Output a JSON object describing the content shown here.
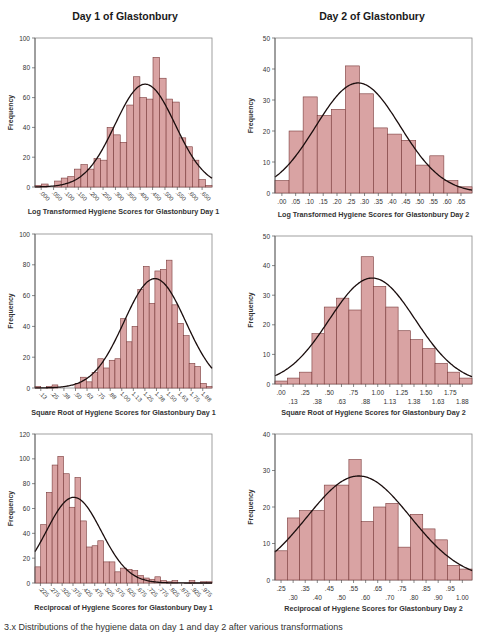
{
  "column_titles": [
    "Day 1 of Glastonbury",
    "Day 2 of Glastonbury"
  ],
  "caption": "3.x  Distributions of the hygiene data on day 1 and day 2 after various transformations",
  "colors": {
    "bar_fill": "#d9a3a3",
    "bar_stroke": "#7a3b3b",
    "curve": "#1a0d0d",
    "axis": "#555555",
    "frame": "#888888",
    "text": "#333333"
  },
  "chart_data": [
    {
      "id": "log-day1",
      "type": "bar",
      "title": "",
      "xlabel": "Log Transformed Hygiene Scores for Glastonbury Day 1",
      "ylabel": "Frequency",
      "ylim": [
        0,
        100
      ],
      "yticks": [
        0,
        20,
        40,
        60,
        80,
        100
      ],
      "xtick_labels": [
        ".000",
        ".050",
        ".100",
        ".150",
        ".200",
        ".250",
        ".300",
        ".350",
        ".400",
        ".450",
        ".500",
        ".550",
        ".600",
        ".650"
      ],
      "xtick_rotated": true,
      "values": [
        1,
        2,
        0,
        4,
        6,
        7,
        12,
        15,
        12,
        19,
        18,
        40,
        35,
        30,
        55,
        74,
        60,
        59,
        87,
        73,
        59,
        57,
        33,
        27,
        18,
        5,
        1
      ],
      "normal_curve": {
        "mean_bin": 16.8,
        "sd_bins": 4.6,
        "peak": 69
      },
      "box": {
        "x": 35,
        "y": 38,
        "w": 177,
        "h": 149
      }
    },
    {
      "id": "log-day2",
      "type": "bar",
      "title": "",
      "xlabel": "Log Transformed Hygiene Scores for Glastonbury Day 2",
      "ylabel": "Frequency",
      "ylim": [
        0,
        50
      ],
      "yticks": [
        0,
        10,
        20,
        30,
        40,
        50
      ],
      "xtick_labels": [
        ".00",
        ".05",
        ".10",
        ".15",
        ".20",
        ".25",
        ".30",
        ".35",
        ".40",
        ".45",
        ".50",
        ".55",
        ".60",
        ".65"
      ],
      "xtick_rotated": false,
      "values": [
        4,
        20,
        31,
        25,
        27,
        41,
        32,
        21,
        19,
        17,
        9,
        12,
        4,
        2
      ],
      "normal_curve": {
        "mean_bin": 5.9,
        "sd_bins": 3.0,
        "peak": 35.5
      },
      "box": {
        "x": 275,
        "y": 38,
        "w": 197,
        "h": 155
      }
    },
    {
      "id": "sqrt-day1",
      "type": "bar",
      "title": "",
      "xlabel": "Square Root of Hygiene Scores for Glastonbury Day 1",
      "ylabel": "Frequency",
      "ylim": [
        0,
        100
      ],
      "yticks": [
        0,
        20,
        40,
        60,
        80,
        100
      ],
      "xtick_labels": [
        ".13",
        ".25",
        ".38",
        ".50",
        ".63",
        ".75",
        ".88",
        "1.00",
        "1.13",
        "1.25",
        "1.38",
        "1.50",
        "1.63",
        "1.75",
        "1.88"
      ],
      "xtick_rotated": true,
      "values": [
        1,
        0,
        1,
        2,
        0,
        0,
        0,
        3,
        7,
        4,
        10,
        19,
        13,
        18,
        19,
        45,
        30,
        40,
        64,
        79,
        55,
        76,
        77,
        83,
        54,
        42,
        34,
        16,
        14,
        3,
        1
      ],
      "normal_curve": {
        "mean_bin": 21.0,
        "sd_bins": 5.4,
        "peak": 71
      },
      "box": {
        "x": 35,
        "y": 234,
        "w": 177,
        "h": 154
      }
    },
    {
      "id": "sqrt-day2",
      "type": "bar",
      "title": "",
      "xlabel": "Square Root of Hygiene Scores for Glastonbury Day 2",
      "ylabel": "Frequency",
      "ylim": [
        0,
        50
      ],
      "yticks": [
        0,
        10,
        20,
        30,
        40,
        50
      ],
      "xtick_labels": [
        ".00",
        ".13",
        ".25",
        ".38",
        ".50",
        ".63",
        ".75",
        ".88",
        "1.00",
        "1.13",
        "1.25",
        "1.38",
        "1.50",
        "1.63",
        "1.75",
        "1.88"
      ],
      "xtick_rotated": false,
      "xtick_staggered": true,
      "values": [
        1,
        2,
        4,
        17,
        26,
        29,
        25,
        43,
        33,
        26,
        18,
        15,
        12,
        7,
        4,
        2
      ],
      "normal_curve": {
        "mean_bin": 7.9,
        "sd_bins": 3.5,
        "peak": 35.8
      },
      "box": {
        "x": 275,
        "y": 236,
        "w": 197,
        "h": 148
      }
    },
    {
      "id": "recip-day1",
      "type": "bar",
      "title": "",
      "xlabel": "Reciprocal of Hygiene Scores for Glastonbury Day 1",
      "ylabel": "Frequency",
      "ylim": [
        0,
        120
      ],
      "yticks": [
        0,
        20,
        40,
        60,
        80,
        100,
        120
      ],
      "xtick_labels": [
        ".225",
        ".275",
        ".325",
        ".375",
        ".425",
        ".475",
        ".525",
        ".575",
        ".625",
        ".675",
        ".725",
        ".775",
        ".825",
        ".875",
        ".925",
        ".975"
      ],
      "xtick_rotated": true,
      "values": [
        13,
        47,
        73,
        95,
        102,
        88,
        61,
        85,
        50,
        29,
        30,
        34,
        17,
        17,
        9,
        12,
        11,
        10,
        6,
        4,
        3,
        5,
        2,
        1,
        2,
        0,
        0,
        2,
        0,
        1,
        1
      ],
      "normal_curve": {
        "mean_bin": 6.8,
        "sd_bins": 4.8,
        "peak": 69
      },
      "box": {
        "x": 35,
        "y": 434,
        "w": 177,
        "h": 149
      }
    },
    {
      "id": "recip-day2",
      "type": "bar",
      "title": "",
      "xlabel": "Reciprocal of Hygiene Scores for Glastonbury Day 2",
      "ylabel": "Frequency",
      "ylim": [
        0,
        40
      ],
      "yticks": [
        0,
        10,
        20,
        30,
        40
      ],
      "xtick_labels": [
        ".25",
        ".30",
        ".35",
        ".40",
        ".45",
        ".50",
        ".55",
        ".60",
        ".65",
        ".70",
        ".75",
        ".80",
        ".85",
        ".90",
        ".95",
        "1.00"
      ],
      "xtick_rotated": false,
      "xtick_staggered": true,
      "values": [
        8,
        17,
        19,
        19,
        26,
        26,
        33,
        16,
        20,
        21,
        9,
        18,
        14,
        11,
        4,
        3
      ],
      "normal_curve": {
        "mean_bin": 6.8,
        "sd_bins": 4.2,
        "peak": 28.5
      },
      "box": {
        "x": 275,
        "y": 434,
        "w": 197,
        "h": 146
      }
    }
  ]
}
